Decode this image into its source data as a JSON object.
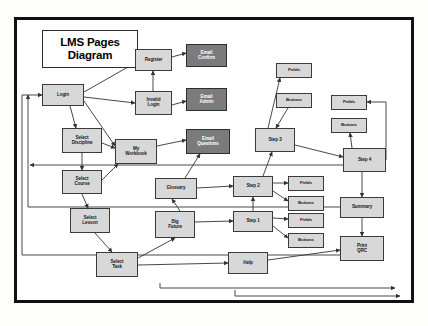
{
  "diagram": {
    "title": "LMS Pages\nDiagram",
    "title_line1": "LMS Pages",
    "title_line2": "Diagram",
    "colors": {
      "light_node_fill": "#d8d8d8",
      "dark_node_fill": "#7b7b7b",
      "node_border": "#3a3a3a",
      "frame_border": "#111111",
      "page_background": "#ffffff",
      "edge_stroke": "#333333",
      "dark_node_text": "#ffffff",
      "light_node_text": "#1a1a1a"
    },
    "nodes": [
      {
        "id": "login",
        "label": "Login",
        "style": "light",
        "x": 42,
        "y": 84,
        "w": 42,
        "h": 22
      },
      {
        "id": "register",
        "label": "Register",
        "style": "light",
        "x": 135,
        "y": 49,
        "w": 37,
        "h": 22
      },
      {
        "id": "invalid_login",
        "label": "Invalid\nLogin",
        "style": "light",
        "x": 135,
        "y": 91,
        "w": 37,
        "h": 24
      },
      {
        "id": "email_confirm",
        "label": "Email\nConfirm",
        "style": "dark",
        "x": 186,
        "y": 44,
        "w": 41,
        "h": 23
      },
      {
        "id": "email_admin",
        "label": "Email\nAdmin",
        "style": "dark",
        "x": 186,
        "y": 88,
        "w": 41,
        "h": 23
      },
      {
        "id": "select_discipline",
        "label": "Select\nDiscipline",
        "style": "light",
        "x": 62,
        "y": 128,
        "w": 40,
        "h": 25
      },
      {
        "id": "my_workbook",
        "label": "My\nWorkbook",
        "style": "light",
        "x": 115,
        "y": 139,
        "w": 42,
        "h": 25
      },
      {
        "id": "email_questions",
        "label": "Email\nQuestions",
        "style": "dark",
        "x": 186,
        "y": 129,
        "w": 44,
        "h": 25
      },
      {
        "id": "select_course",
        "label": "Select\nCourse",
        "style": "light",
        "x": 62,
        "y": 170,
        "w": 40,
        "h": 24
      },
      {
        "id": "glossary",
        "label": "Glossary",
        "style": "light",
        "x": 155,
        "y": 178,
        "w": 42,
        "h": 21
      },
      {
        "id": "select_lesson",
        "label": "Select\nLesson",
        "style": "light",
        "x": 70,
        "y": 208,
        "w": 40,
        "h": 25
      },
      {
        "id": "big_picture",
        "label": "Big\nFuture",
        "style": "light",
        "x": 155,
        "y": 211,
        "w": 40,
        "h": 27
      },
      {
        "id": "select_task",
        "label": "Select\nTask",
        "style": "light",
        "x": 96,
        "y": 252,
        "w": 42,
        "h": 25
      },
      {
        "id": "help",
        "label": "Help",
        "style": "light",
        "x": 228,
        "y": 252,
        "w": 40,
        "h": 22
      },
      {
        "id": "step1",
        "label": "Step 1",
        "style": "light",
        "x": 233,
        "y": 211,
        "w": 40,
        "h": 21
      },
      {
        "id": "step2",
        "label": "Step 2",
        "style": "light",
        "x": 233,
        "y": 176,
        "w": 40,
        "h": 21
      },
      {
        "id": "step3",
        "label": "Step 3",
        "style": "light",
        "x": 255,
        "y": 128,
        "w": 40,
        "h": 24
      },
      {
        "id": "step4",
        "label": "Step 4",
        "style": "light",
        "x": 343,
        "y": 148,
        "w": 43,
        "h": 24
      },
      {
        "id": "fields_s3",
        "label": "Fields",
        "style": "small",
        "x": 276,
        "y": 63,
        "w": 36,
        "h": 15
      },
      {
        "id": "buttons_s3",
        "label": "Buttons",
        "style": "small",
        "x": 276,
        "y": 93,
        "w": 36,
        "h": 15
      },
      {
        "id": "fields_s4",
        "label": "Fields",
        "style": "small",
        "x": 331,
        "y": 95,
        "w": 36,
        "h": 15
      },
      {
        "id": "buttons_s4",
        "label": "Buttons",
        "style": "small",
        "x": 331,
        "y": 118,
        "w": 36,
        "h": 15
      },
      {
        "id": "fields_s2",
        "label": "Fields",
        "style": "small",
        "x": 288,
        "y": 176,
        "w": 36,
        "h": 15
      },
      {
        "id": "buttons_s2",
        "label": "Buttons",
        "style": "small",
        "x": 288,
        "y": 196,
        "w": 36,
        "h": 15
      },
      {
        "id": "fields_s1",
        "label": "Fields",
        "style": "small",
        "x": 288,
        "y": 213,
        "w": 36,
        "h": 15
      },
      {
        "id": "buttons_s1",
        "label": "Buttons",
        "style": "small",
        "x": 288,
        "y": 233,
        "w": 36,
        "h": 15
      },
      {
        "id": "summary",
        "label": "Summary",
        "style": "light",
        "x": 340,
        "y": 197,
        "w": 44,
        "h": 21
      },
      {
        "id": "print_qrc",
        "label": "Print\nQRC",
        "style": "light",
        "x": 340,
        "y": 236,
        "w": 44,
        "h": 25
      }
    ],
    "edges": [
      {
        "from": "login",
        "to": "register",
        "d": "M84,92 L135,63"
      },
      {
        "from": "login",
        "to": "invalid_login",
        "d": "M84,97 L135,103"
      },
      {
        "from": "login",
        "to": "my_workbook",
        "d": "M84,101 L115,146"
      },
      {
        "from": "login",
        "to": "select_discipline",
        "d": "M70,106 L76,128"
      },
      {
        "from": "register",
        "to": "email_confirm",
        "d": "M172,57 L186,53"
      },
      {
        "from": "invalid_login",
        "to": "register",
        "d": "M153,91 L153,71"
      },
      {
        "from": "invalid_login",
        "to": "email_admin",
        "d": "M172,105 L186,101"
      },
      {
        "from": "select_discipline",
        "to": "select_course",
        "d": "M82,153 L82,170"
      },
      {
        "from": "select_course",
        "to": "select_lesson",
        "d": "M82,194 L88,208"
      },
      {
        "from": "select_lesson",
        "to": "select_task",
        "d": "M95,233 L112,252"
      },
      {
        "from": "select_discipline",
        "to": "my_workbook",
        "d": "M102,143 L115,148"
      },
      {
        "from": "select_course",
        "to": "my_workbook",
        "d": "M102,180 L118,164"
      },
      {
        "from": "my_workbook",
        "to": "email_questions",
        "d": "M157,146 L186,140"
      },
      {
        "from": "glossary",
        "to": "email_questions",
        "d": "M185,178 L200,154"
      },
      {
        "from": "glossary",
        "to": "step2",
        "d": "M197,188 L233,186"
      },
      {
        "from": "big_picture",
        "to": "glossary",
        "d": "M180,211 L172,199"
      },
      {
        "from": "big_picture",
        "to": "step1",
        "d": "M195,222 L233,221"
      },
      {
        "from": "select_task",
        "to": "big_picture",
        "d": "M138,258 L175,238"
      },
      {
        "from": "step1",
        "to": "step2",
        "d": "M253,211 L253,197"
      },
      {
        "from": "step2",
        "to": "step3",
        "d": "M263,176 L272,152"
      },
      {
        "from": "step3",
        "to": "step4",
        "d": "M295,145 L343,157"
      },
      {
        "from": "step3",
        "to": "fields_s3",
        "d": "M268,128 L280,78"
      },
      {
        "from": "buttons_s3",
        "to": "step3",
        "d": "M288,108 L276,128"
      },
      {
        "from": "step4",
        "to": "fields_s4",
        "d": "M386,160 L386,102 L367,102"
      },
      {
        "from": "step4",
        "to": "buttons_s4",
        "d": "M352,148 L350,133"
      },
      {
        "from": "step2",
        "to": "fields_s2",
        "d": "M273,183 L288,183"
      },
      {
        "from": "step2",
        "to": "buttons_s2",
        "d": "M273,191 L288,201"
      },
      {
        "from": "step1",
        "to": "fields_s1",
        "d": "M273,218 L288,219"
      },
      {
        "from": "step1",
        "to": "buttons_s1",
        "d": "M273,226 L288,238"
      },
      {
        "from": "step4",
        "to": "summary",
        "d": "M362,172 L362,197"
      },
      {
        "from": "summary",
        "to": "print_qrc",
        "d": "M362,218 L362,236"
      },
      {
        "from": "help",
        "to": "print_qrc",
        "d": "M268,260 L340,250"
      },
      {
        "from": "select_task",
        "to": "help",
        "d": "M138,265 L228,263"
      },
      {
        "from": "print_qrc",
        "to": "login",
        "d": "M340,255 L22,255 L22,95 L42,95"
      },
      {
        "from": "summary",
        "to": "login",
        "d": "M340,207 L28,207 L28,95"
      },
      {
        "from": "step4",
        "to": "select_lesson",
        "d": "M343,165 L30,165"
      },
      {
        "from": "bottom_return_1",
        "to": "login",
        "d": "M235,290 L235,296 L400,296"
      },
      {
        "from": "bottom_return_2",
        "to": "select_task",
        "d": "M160,283 L160,288 L395,288"
      }
    ]
  }
}
